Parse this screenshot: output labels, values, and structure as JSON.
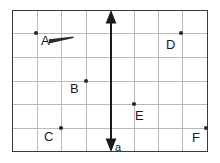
{
  "figure": {
    "background_color": "#ffffff",
    "border_color": "#3a3a3a",
    "grid_color": "#b9b9b9",
    "ink_color": "#1a1a1a",
    "plot_frame": {
      "x": 12,
      "y": 10,
      "width": 196,
      "height": 142
    },
    "grid": {
      "columns": 8,
      "rows": 6,
      "vertical_lines_x": [
        12,
        37,
        61,
        86,
        111,
        134,
        158,
        182,
        208
      ],
      "horizontal_lines_y": [
        10,
        33,
        57,
        81,
        104,
        128,
        152
      ]
    },
    "axis": {
      "name": "a",
      "label": "a",
      "orientation": "vertical",
      "x": 111,
      "y_top": 11,
      "y_bottom": 152,
      "double_headed": true,
      "label_x": 115,
      "label_y": 151,
      "color": "#1a1a1a"
    },
    "points": [
      {
        "id": "A",
        "label": "A",
        "dot_x": 36,
        "dot_y": 33,
        "label_x": 41,
        "label_y": 45
      },
      {
        "id": "B",
        "label": "B",
        "dot_x": 86,
        "dot_y": 81,
        "label_x": 70,
        "label_y": 93
      },
      {
        "id": "C",
        "label": "C",
        "dot_x": 61,
        "dot_y": 128,
        "label_x": 44,
        "label_y": 141
      },
      {
        "id": "D",
        "label": "D",
        "dot_x": 181,
        "dot_y": 33,
        "label_x": 166,
        "label_y": 49
      },
      {
        "id": "E",
        "label": "E",
        "dot_x": 134,
        "dot_y": 104,
        "label_x": 135,
        "label_y": 120
      },
      {
        "id": "F",
        "label": "F",
        "dot_x": 206,
        "dot_y": 128,
        "label_x": 192,
        "label_y": 142
      }
    ],
    "marks": [
      {
        "id": "stroke-near-A",
        "kind": "hand-drawn-streak",
        "from_x": 49,
        "from_y": 41,
        "to_x": 73,
        "to_y": 37,
        "thickness_start": 4.2,
        "thickness_end": 1.2,
        "color": "#2b2b2b"
      }
    ]
  }
}
